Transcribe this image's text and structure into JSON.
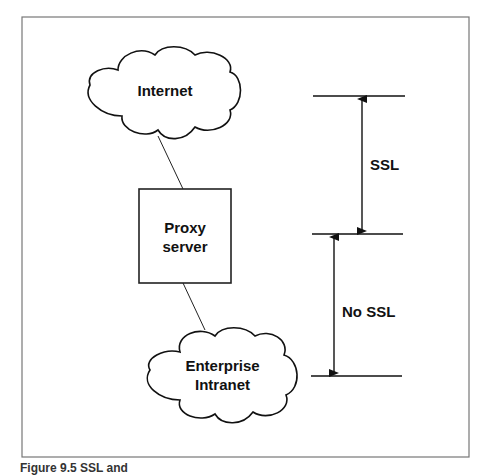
{
  "nodes": {
    "internet": {
      "label": "Internet"
    },
    "proxy": {
      "label_line1": "Proxy",
      "label_line2": "server"
    },
    "intranet": {
      "label_line1": "Enterprise",
      "label_line2": "Intranet"
    }
  },
  "segments": {
    "ssl": {
      "label": "SSL"
    },
    "no_ssl": {
      "label": "No SSL"
    }
  },
  "caption": "Figure 9.5  SSL and"
}
